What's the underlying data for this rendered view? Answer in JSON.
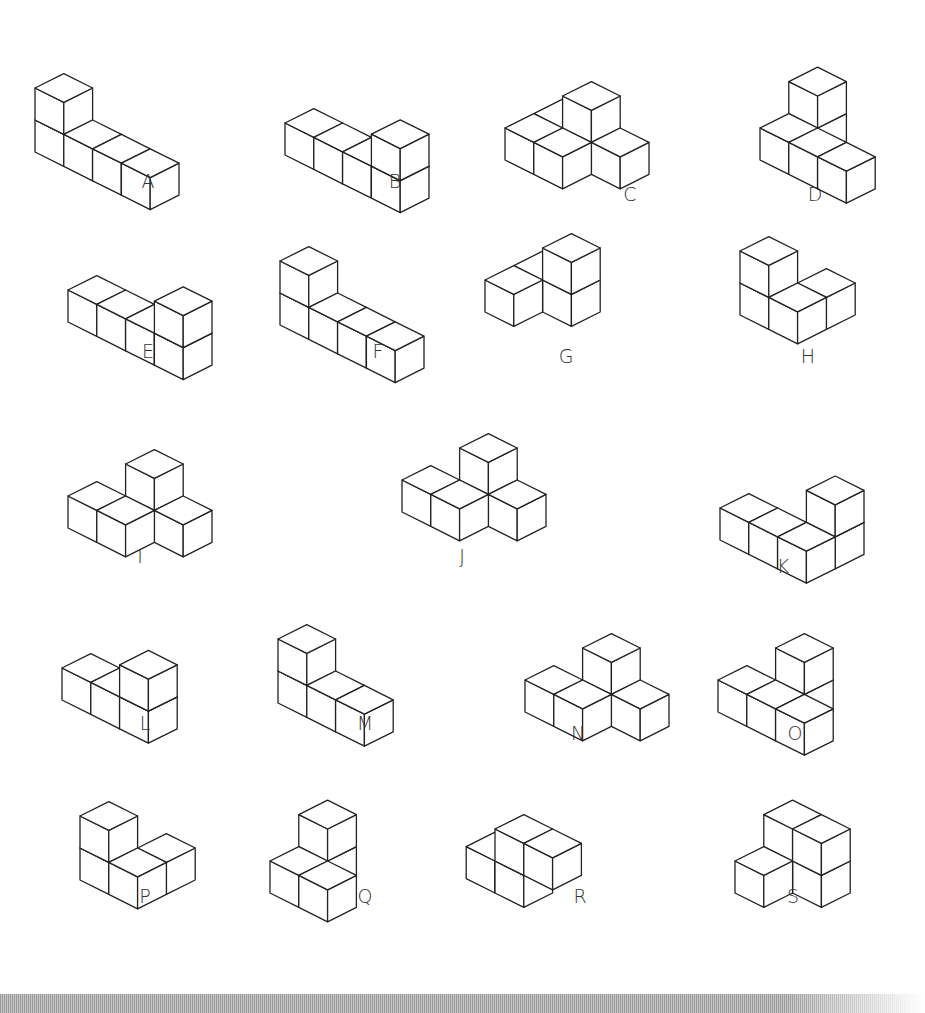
{
  "figures": [
    {
      "label": "A",
      "x": 95,
      "y": 152,
      "cubes": [
        [
          0,
          0,
          0
        ],
        [
          0,
          0,
          1
        ],
        [
          1,
          0,
          0
        ],
        [
          2,
          0,
          0
        ],
        [
          3,
          0,
          0
        ]
      ]
    },
    {
      "label": "B",
      "x": 345,
      "y": 155,
      "cubes": [
        [
          0,
          0,
          0
        ],
        [
          1,
          0,
          0
        ],
        [
          2,
          0,
          0
        ],
        [
          3,
          0,
          0
        ],
        [
          3,
          0,
          1
        ]
      ]
    },
    {
      "label": "C",
      "x": 565,
      "y": 160,
      "cubes": [
        [
          0,
          0,
          0
        ],
        [
          1,
          0,
          0
        ],
        [
          1,
          1,
          0
        ],
        [
          1,
          1,
          1
        ],
        [
          2,
          1,
          0
        ],
        [
          0,
          1,
          0
        ]
      ]
    },
    {
      "label": "D",
      "x": 820,
      "y": 160,
      "cubes": [
        [
          0,
          0,
          0
        ],
        [
          0,
          1,
          0
        ],
        [
          0,
          1,
          1
        ],
        [
          1,
          0,
          0
        ],
        [
          2,
          0,
          0
        ]
      ]
    },
    {
      "label": "E",
      "x": 128,
      "y": 322,
      "cubes": [
        [
          0,
          0,
          0
        ],
        [
          1,
          0,
          0
        ],
        [
          2,
          0,
          0
        ],
        [
          3,
          0,
          0
        ],
        [
          3,
          0,
          1
        ]
      ]
    },
    {
      "label": "F",
      "x": 340,
      "y": 325,
      "cubes": [
        [
          0,
          0,
          0
        ],
        [
          0,
          0,
          1
        ],
        [
          1,
          0,
          0
        ],
        [
          2,
          0,
          0
        ],
        [
          3,
          0,
          0
        ]
      ]
    },
    {
      "label": "G",
      "x": 545,
      "y": 312,
      "cubes": [
        [
          0,
          0,
          0
        ],
        [
          0,
          1,
          0
        ],
        [
          1,
          1,
          0
        ],
        [
          1,
          1,
          1
        ]
      ]
    },
    {
      "label": "H",
      "x": 800,
      "y": 315,
      "cubes": [
        [
          0,
          0,
          0
        ],
        [
          0,
          0,
          1
        ],
        [
          1,
          0,
          0
        ],
        [
          1,
          1,
          0
        ]
      ]
    },
    {
      "label": "I",
      "x": 128,
      "y": 528,
      "cubes": [
        [
          0,
          0,
          0
        ],
        [
          1,
          0,
          0
        ],
        [
          1,
          1,
          0
        ],
        [
          1,
          1,
          1
        ],
        [
          2,
          1,
          0
        ]
      ]
    },
    {
      "label": "J",
      "x": 462,
      "y": 512,
      "cubes": [
        [
          0,
          0,
          0
        ],
        [
          1,
          0,
          0
        ],
        [
          1,
          1,
          0
        ],
        [
          1,
          1,
          1
        ],
        [
          2,
          1,
          0
        ]
      ]
    },
    {
      "label": "K",
      "x": 780,
      "y": 540,
      "cubes": [
        [
          0,
          0,
          0
        ],
        [
          1,
          0,
          0
        ],
        [
          2,
          0,
          0
        ],
        [
          2,
          1,
          0
        ],
        [
          2,
          1,
          1
        ]
      ]
    },
    {
      "label": "L",
      "x": 122,
      "y": 700,
      "cubes": [
        [
          0,
          0,
          0
        ],
        [
          1,
          0,
          0
        ],
        [
          2,
          0,
          0
        ],
        [
          2,
          0,
          1
        ]
      ]
    },
    {
      "label": "M",
      "x": 338,
      "y": 703,
      "cubes": [
        [
          0,
          0,
          0
        ],
        [
          0,
          0,
          1
        ],
        [
          1,
          0,
          0
        ],
        [
          2,
          0,
          0
        ]
      ]
    },
    {
      "label": "N",
      "x": 585,
      "y": 712,
      "cubes": [
        [
          0,
          0,
          0
        ],
        [
          1,
          0,
          0
        ],
        [
          1,
          1,
          0
        ],
        [
          1,
          1,
          1
        ],
        [
          2,
          1,
          0
        ]
      ]
    },
    {
      "label": "O",
      "x": 778,
      "y": 712,
      "cubes": [
        [
          0,
          0,
          0
        ],
        [
          1,
          0,
          0
        ],
        [
          1,
          1,
          0
        ],
        [
          1,
          1,
          1
        ],
        [
          2,
          0,
          0
        ]
      ]
    },
    {
      "label": "P",
      "x": 140,
      "y": 880,
      "cubes": [
        [
          0,
          0,
          0
        ],
        [
          0,
          0,
          1
        ],
        [
          1,
          0,
          0
        ],
        [
          1,
          1,
          0
        ]
      ]
    },
    {
      "label": "Q",
      "x": 330,
      "y": 893,
      "cubes": [
        [
          0,
          0,
          0
        ],
        [
          0,
          1,
          0
        ],
        [
          0,
          1,
          1
        ],
        [
          1,
          0,
          0
        ]
      ]
    },
    {
      "label": "R",
      "x": 555,
      "y": 893,
      "cubes": [
        [
          0,
          0,
          0
        ],
        [
          0,
          0,
          1
        ],
        [
          1,
          0,
          1
        ],
        [
          -1,
          0,
          0
        ]
      ]
    },
    {
      "label": "S",
      "x": 795,
      "y": 893,
      "cubes": [
        [
          0,
          0,
          0
        ],
        [
          0,
          1,
          0
        ],
        [
          0,
          1,
          1
        ],
        [
          1,
          1,
          0
        ],
        [
          1,
          1,
          1
        ]
      ]
    }
  ],
  "label_positions": [
    {
      "x": 148,
      "y": 170
    },
    {
      "x": 395,
      "y": 170
    },
    {
      "x": 630,
      "y": 183
    },
    {
      "x": 815,
      "y": 183
    },
    {
      "x": 148,
      "y": 340
    },
    {
      "x": 378,
      "y": 340
    },
    {
      "x": 566,
      "y": 345
    },
    {
      "x": 808,
      "y": 345
    },
    {
      "x": 140,
      "y": 545
    },
    {
      "x": 462,
      "y": 545
    },
    {
      "x": 783,
      "y": 555
    },
    {
      "x": 145,
      "y": 712
    },
    {
      "x": 365,
      "y": 712
    },
    {
      "x": 578,
      "y": 722
    },
    {
      "x": 795,
      "y": 722
    },
    {
      "x": 145,
      "y": 885
    },
    {
      "x": 365,
      "y": 885
    },
    {
      "x": 580,
      "y": 885
    },
    {
      "x": 793,
      "y": 885
    }
  ]
}
